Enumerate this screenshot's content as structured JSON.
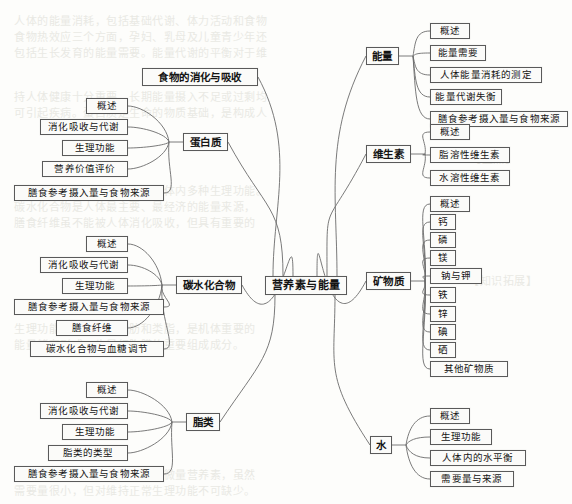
{
  "diagram": {
    "title": "营养素与能量",
    "type": "mind-map",
    "background_note": "扫描书页背面透印文字"
  },
  "center": {
    "label": "营养素与能量"
  },
  "left": [
    {
      "label": "食物的消化与吸收",
      "children": []
    },
    {
      "label": "蛋白质",
      "children": [
        {
          "label": "概述"
        },
        {
          "label": "消化吸收与代谢"
        },
        {
          "label": "生理功能"
        },
        {
          "label": "营养价值评价"
        },
        {
          "label": "膳食参考摄入量与食物来源"
        }
      ]
    },
    {
      "label": "碳水化合物",
      "children": [
        {
          "label": "概述"
        },
        {
          "label": "消化吸收与代谢"
        },
        {
          "label": "生理功能"
        },
        {
          "label": "膳食参考摄入量与食物来源"
        },
        {
          "label": "膳食纤维"
        },
        {
          "label": "碳水化合物与血糖调节"
        }
      ]
    },
    {
      "label": "脂类",
      "children": [
        {
          "label": "概述"
        },
        {
          "label": "消化吸收与代谢"
        },
        {
          "label": "生理功能"
        },
        {
          "label": "脂类的类型"
        },
        {
          "label": "膳食参考摄入量与食物来源"
        }
      ]
    }
  ],
  "right": [
    {
      "label": "能量",
      "children": [
        {
          "label": "概述"
        },
        {
          "label": "能量需要"
        },
        {
          "label": "人体能量消耗的测定"
        },
        {
          "label": "能量代谢失衡"
        },
        {
          "label": "膳食参考摄入量与食物来源"
        }
      ]
    },
    {
      "label": "维生素",
      "children": [
        {
          "label": "概述"
        },
        {
          "label": "脂溶性维生素"
        },
        {
          "label": "水溶性维生素"
        }
      ]
    },
    {
      "label": "矿物质",
      "children": [
        {
          "label": "概述"
        },
        {
          "label": "钙"
        },
        {
          "label": "磷"
        },
        {
          "label": "镁"
        },
        {
          "label": "钠与钾"
        },
        {
          "label": "铁"
        },
        {
          "label": "锌"
        },
        {
          "label": "碘"
        },
        {
          "label": "硒"
        },
        {
          "label": "其他矿物质"
        }
      ]
    },
    {
      "label": "水",
      "children": [
        {
          "label": "概述"
        },
        {
          "label": "生理功能"
        },
        {
          "label": "人体内的水平衡"
        },
        {
          "label": "需要量与来源"
        }
      ]
    }
  ],
  "bleed_through": [
    {
      "text": "人体的能量消耗，包括基础代谢、体力活动和食物",
      "x": 14,
      "y": 12
    },
    {
      "text": "食物热效应三个方面，孕妇、乳母及儿童青少年还",
      "x": 14,
      "y": 28
    },
    {
      "text": "包括生长发育的能量需要。能量代谢的平衡对于维",
      "x": 14,
      "y": 44
    },
    {
      "text": "持人体健康十分重要，长期能量摄入不足或过剩均",
      "x": 14,
      "y": 88
    },
    {
      "text": "可引起疾病。蛋白质是生命的物质基础，是构成人",
      "x": 14,
      "y": 104
    },
    {
      "text": "体组织细胞的重要成分，参与体内多种生理功能。",
      "x": 14,
      "y": 182
    },
    {
      "text": "【重点】",
      "x": 470,
      "y": 150
    },
    {
      "text": "碳水化合物是人体最主要、最经济的能量来源，",
      "x": 14,
      "y": 198
    },
    {
      "text": "【知识拓展】",
      "x": 468,
      "y": 272
    },
    {
      "text": "膳食纤维虽不能被人体消化吸收，但具有重要的",
      "x": 14,
      "y": 214
    },
    {
      "text": "生理功能。脂类包括脂肪和类脂，是机体重要的",
      "x": 14,
      "y": 320
    },
    {
      "text": "能量储存形式，也是细胞膜的重要组成成分。",
      "x": 14,
      "y": 336
    },
    {
      "text": "矿物质和维生素是人体必需的微量营养素，虽然",
      "x": 14,
      "y": 466
    },
    {
      "text": "需要量很小，但对维持正常生理功能不可缺少。",
      "x": 14,
      "y": 482
    }
  ]
}
